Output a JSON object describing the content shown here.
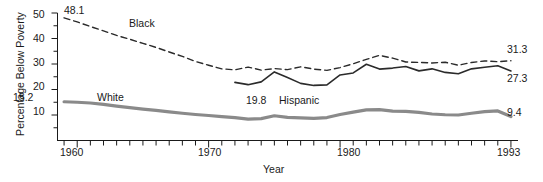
{
  "chart_data": {
    "type": "line",
    "title": "",
    "xlabel": "Year",
    "ylabel": "Percentage Below Poverty",
    "xlim": [
      1958.5,
      1993.5
    ],
    "ylim": [
      0,
      52
    ],
    "grid": false,
    "legend": "inline-annotations",
    "y_ticks_major": [
      10,
      20,
      30,
      40,
      50
    ],
    "y_ticks_minor": [
      5,
      15,
      25,
      35,
      45
    ],
    "x_tick_labels": [
      "1960",
      "1970",
      "1980",
      "1993"
    ],
    "x_tick_label_years": [
      1960,
      1970,
      1980,
      1993
    ],
    "x_ticks_all_years_from": 1959,
    "x_ticks_all_years_to": 1993,
    "series": [
      {
        "name": "Black",
        "style": "dashed",
        "color": "#2b2b2b",
        "width": 1.4,
        "label_position": "above-line",
        "start_value_label": "48.1",
        "end_value_label": "31.3",
        "x": [
          1959,
          1960,
          1961,
          1962,
          1963,
          1964,
          1965,
          1966,
          1967,
          1968,
          1969,
          1970,
          1971,
          1972,
          1973,
          1974,
          1975,
          1976,
          1977,
          1978,
          1979,
          1980,
          1981,
          1982,
          1983,
          1984,
          1985,
          1986,
          1987,
          1988,
          1989,
          1990,
          1991,
          1992,
          1993
        ],
        "values": [
          48.1,
          46.5,
          44.7,
          43.0,
          41.2,
          39.7,
          38.1,
          36.5,
          34.7,
          33.0,
          31.0,
          29.5,
          28.1,
          27.7,
          28.8,
          27.6,
          28.2,
          27.8,
          28.9,
          28.0,
          27.5,
          28.6,
          30.1,
          31.8,
          33.4,
          32.3,
          30.8,
          30.6,
          30.4,
          30.7,
          29.5,
          30.6,
          31.2,
          30.9,
          31.3
        ]
      },
      {
        "name": "Hispanic",
        "style": "solid",
        "color": "#2b2b2b",
        "width": 1.6,
        "label_position": "below-line",
        "start_value_label": "19.8",
        "end_value_label": "27.3",
        "x": [
          1972,
          1973,
          1974,
          1975,
          1976,
          1977,
          1978,
          1979,
          1980,
          1981,
          1982,
          1983,
          1984,
          1985,
          1986,
          1987,
          1988,
          1989,
          1990,
          1991,
          1992,
          1993
        ],
        "values": [
          22.8,
          21.9,
          23.0,
          26.9,
          24.7,
          22.4,
          21.6,
          21.8,
          25.7,
          26.5,
          29.9,
          28.0,
          28.4,
          29.0,
          27.3,
          28.1,
          26.7,
          26.2,
          28.1,
          28.7,
          29.3,
          27.3
        ]
      },
      {
        "name": "White",
        "style": "solid",
        "color": "#8a8a8a",
        "width": 3.2,
        "label_position": "above-line",
        "start_value_label": "15.2",
        "end_value_label": "9.4",
        "x": [
          1959,
          1960,
          1961,
          1962,
          1963,
          1964,
          1965,
          1966,
          1967,
          1968,
          1969,
          1970,
          1971,
          1972,
          1973,
          1974,
          1975,
          1976,
          1977,
          1978,
          1979,
          1980,
          1981,
          1982,
          1983,
          1984,
          1985,
          1986,
          1987,
          1988,
          1989,
          1990,
          1991,
          1992,
          1993
        ],
        "values": [
          15.2,
          15.0,
          14.7,
          14.2,
          13.5,
          12.9,
          12.3,
          11.8,
          11.2,
          10.7,
          10.2,
          9.8,
          9.4,
          9.0,
          8.4,
          8.6,
          9.7,
          9.1,
          8.9,
          8.7,
          9.0,
          10.2,
          11.1,
          12.0,
          12.1,
          11.5,
          11.4,
          11.0,
          10.4,
          10.1,
          10.0,
          10.7,
          11.3,
          11.6,
          9.4
        ]
      }
    ],
    "annotations": [
      {
        "text": "48.1",
        "series": "Black",
        "kind": "start-value"
      },
      {
        "text": "31.3",
        "series": "Black",
        "kind": "end-value"
      },
      {
        "text": "Black",
        "series": "Black",
        "kind": "series-name"
      },
      {
        "text": "19.8",
        "series": "Hispanic",
        "kind": "start-value"
      },
      {
        "text": "27.3",
        "series": "Hispanic",
        "kind": "end-value"
      },
      {
        "text": "Hispanic",
        "series": "Hispanic",
        "kind": "series-name"
      },
      {
        "text": "15.2",
        "series": "White",
        "kind": "start-value"
      },
      {
        "text": "9.4",
        "series": "White",
        "kind": "end-value"
      },
      {
        "text": "White",
        "series": "White",
        "kind": "series-name"
      }
    ]
  },
  "axes": {
    "y_label": "Percentage Below Poverty",
    "x_label": "Year",
    "y_tick_labels": [
      "50",
      "40",
      "30",
      "20",
      "10"
    ],
    "x_tick_labels": [
      "1960",
      "1970",
      "1980",
      "1993"
    ]
  },
  "labels": {
    "black_name": "Black",
    "black_start": "48.1",
    "black_end": "31.3",
    "hispanic_name": "Hispanic",
    "hispanic_start": "19.8",
    "hispanic_end": "27.3",
    "white_name": "White",
    "white_start": "15.2",
    "white_end": "9.4"
  },
  "colors": {
    "ink": "#1a1a1a",
    "white_series": "#8a8a8a",
    "dark_series": "#2b2b2b",
    "background": "#ffffff"
  }
}
